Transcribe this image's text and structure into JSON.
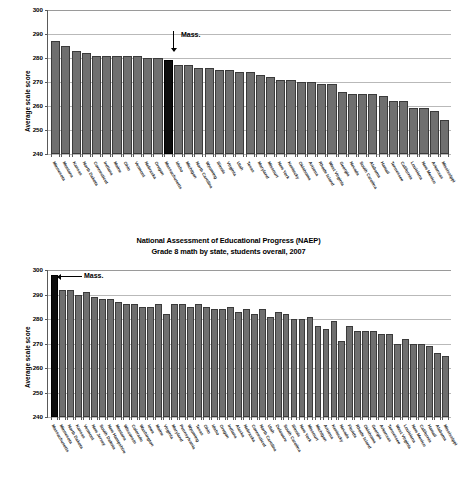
{
  "figure": {
    "source_label": "NAEP state comparison figure"
  },
  "chart_data": [
    {
      "type": "bar",
      "title": "Grade 4 math by state, students overall, 2007",
      "title_line1": "Grade 4 math by state, students overall, 2007",
      "xlabel": "",
      "ylabel": "Average scale score",
      "ylim": [
        240,
        300
      ],
      "yticks": [
        240,
        250,
        260,
        270,
        280,
        290,
        300
      ],
      "grid": true,
      "legend": "none",
      "highlight": "Massachusetts",
      "annotation": "Mass.",
      "categories": [
        "Minnesota",
        "Montana",
        "Kansas",
        "North Dakota",
        "Connecticut",
        "Indiana",
        "Maine",
        "Ohio",
        "Vermont",
        "Nebraska",
        "Oregon",
        "Massachusetts",
        "Idaho",
        "Michigan",
        "North Carolina",
        "Wyoming",
        "Illinois",
        "Virginia",
        "Utah",
        "Texas",
        "Maryland",
        "Missouri",
        "New York",
        "Kentucky",
        "Oklahoma",
        "Arizona",
        "Rhode Island",
        "West Virginia",
        "Georgia",
        "Nevada",
        "South Carolina",
        "Alabama",
        "Hawaii",
        "Tennessee",
        "California",
        "Louisiana",
        "New Mexico",
        "Arkansas",
        "Mississippi"
      ],
      "values": [
        287,
        285,
        283,
        282,
        281,
        281,
        281,
        281,
        281,
        280,
        280,
        279,
        277,
        277,
        276,
        276,
        275,
        275,
        274,
        274,
        273,
        272,
        271,
        271,
        270,
        270,
        269,
        269,
        266,
        265,
        265,
        265,
        264,
        262,
        262,
        259,
        259,
        258,
        254
      ]
    },
    {
      "type": "bar",
      "title": "National Assessment of Educational Progress (NAEP) Grade 8 math by state, students overall, 2007",
      "title_line1": "National Assessment of Educational Progress (NAEP)",
      "title_line2": "Grade 8 math by state, students overall, 2007",
      "xlabel": "",
      "ylabel": "Average scale score",
      "ylim": [
        240,
        300
      ],
      "yticks": [
        240,
        250,
        260,
        270,
        280,
        290,
        300
      ],
      "grid": true,
      "legend": "none",
      "highlight": "Massachusetts",
      "annotation": "Mass.",
      "categories": [
        "Massachusetts",
        "Minnesota",
        "North Dakota",
        "Kansas",
        "Vermont",
        "New Jersey",
        "South Dakota",
        "New Hampshire",
        "Montana",
        "Wisconsin",
        "Colorado",
        "Washington",
        "Iowa",
        "Maine",
        "Virginia",
        "Maryland",
        "Pennsylvania",
        "Wyoming",
        "Texas",
        "Ohio",
        "Idaho",
        "Oregon",
        "Indiana",
        "Alaska",
        "Nebraska",
        "Connecticut",
        "North Carolina",
        "Utah",
        "Delaware",
        "South Carolina",
        "Illinois",
        "New York",
        "Missouri",
        "Michigan",
        "Arizona",
        "Kentucky",
        "Nevada",
        "Florida",
        "Rhode Island",
        "Oklahoma",
        "Georgia",
        "Arkansas",
        "Tennessee",
        "West Virginia",
        "Louisiana",
        "New Mexico",
        "California",
        "Hawaii",
        "Alabama",
        "Mississippi"
      ],
      "values": [
        298,
        292,
        292,
        290,
        291,
        289,
        288,
        288,
        287,
        286,
        286,
        285,
        285,
        286,
        282,
        286,
        286,
        285,
        286,
        285,
        284,
        284,
        285,
        283,
        284,
        282,
        284,
        281,
        283,
        282,
        280,
        280,
        281,
        277,
        276,
        279,
        271,
        277,
        275,
        275,
        275,
        274,
        274,
        270,
        272,
        270,
        270,
        269,
        266,
        265
      ]
    }
  ]
}
